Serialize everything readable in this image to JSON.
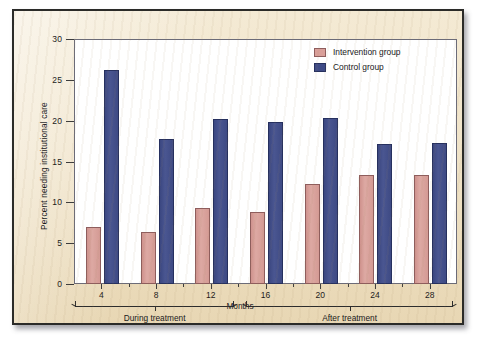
{
  "chart_data": {
    "type": "bar",
    "title": "",
    "xlabel": "Months",
    "ylabel": "Percent needing institutional care",
    "categories": [
      "4",
      "8",
      "12",
      "16",
      "20",
      "24",
      "28"
    ],
    "ylim": [
      0,
      30
    ],
    "yticks": [
      0,
      5,
      10,
      15,
      20,
      25,
      30
    ],
    "grid": false,
    "legend_position": "top-right",
    "series": [
      {
        "name": "Intervention group",
        "color": "#d99f99",
        "values": [
          7.0,
          6.4,
          9.3,
          8.8,
          12.2,
          13.3,
          13.4
        ]
      },
      {
        "name": "Control group",
        "color": "#3f4b86",
        "values": [
          26.2,
          17.7,
          20.2,
          19.8,
          20.3,
          17.2,
          17.3
        ]
      }
    ],
    "annotations": [
      {
        "label": "During treatment",
        "from": "4",
        "to": "12"
      },
      {
        "label": "After treatment",
        "from": "16",
        "to": "28"
      }
    ]
  },
  "legend": {
    "items": [
      {
        "label": "Intervention group"
      },
      {
        "label": "Control group"
      }
    ]
  },
  "axes": {
    "y_title": "Percent needing institutional care",
    "x_title": "Months",
    "y_tick_labels": [
      "30",
      "25",
      "20",
      "15",
      "10",
      "5",
      "0"
    ],
    "x_tick_labels": [
      "4",
      "8",
      "12",
      "16",
      "20",
      "24",
      "28"
    ]
  },
  "brackets": {
    "during": "During treatment",
    "after": "After treatment"
  }
}
